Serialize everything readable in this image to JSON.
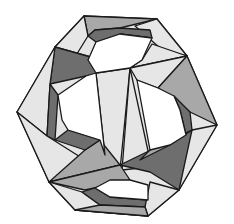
{
  "figure": {
    "title": "Woven polyhedron (triangular strip construction)",
    "colors": {
      "background": "#ffffff",
      "stroke": "#1a1a1a",
      "light": "#e6e6e6",
      "mid": "#a8a8a8",
      "dark": "#6e6e6e",
      "white_hole": "#ffffff"
    },
    "faces": [
      {
        "name": "top-strip",
        "shade": "mid",
        "points": "84,16 157,19 120,28 95,30 88,36"
      },
      {
        "name": "top-left-light",
        "shade": "light",
        "points": "84,16 55,47 75,57 88,36"
      },
      {
        "name": "top-right-light",
        "shade": "light",
        "points": "157,19 187,56 160,48 135,26"
      },
      {
        "name": "top-inner-band",
        "shade": "dark",
        "points": "88,36 95,30 120,28 150,30 152,38 120,34 96,42"
      },
      {
        "name": "upper-left-dark-big",
        "shade": "dark",
        "points": "55,47 130,68 142,60 75,57"
      },
      {
        "name": "upper-left-dark-lower",
        "shade": "dark",
        "points": "55,47 50,84 86,76 130,68"
      },
      {
        "name": "upper-right-light-a",
        "shade": "light",
        "points": "130,68 187,56 152,44 142,60"
      },
      {
        "name": "upper-right-light-b",
        "shade": "light",
        "points": "130,68 187,56 158,88 137,80"
      },
      {
        "name": "right-mid-gray",
        "shade": "mid",
        "points": "187,56 217,125 190,112 158,88"
      },
      {
        "name": "right-inner-dark",
        "shade": "dark",
        "points": "174,96 190,112 192,130 186,135 180,110"
      },
      {
        "name": "left-outer-light",
        "shade": "light",
        "points": "55,47 17,112 47,136 50,84"
      },
      {
        "name": "left-inner-dark",
        "shade": "dark",
        "points": "50,84 47,136 55,140 58,95"
      },
      {
        "name": "center-light-left",
        "shade": "light",
        "points": "96,73 130,68 120,170 105,155"
      },
      {
        "name": "center-light-right",
        "shade": "light",
        "points": "130,68 150,160 140,168 122,170"
      },
      {
        "name": "right-light-lower",
        "shade": "light",
        "points": "217,125 179,190 170,178 192,130"
      },
      {
        "name": "lower-right-dark",
        "shade": "dark",
        "points": "120,165 192,130 179,190 150,172"
      },
      {
        "name": "lower-right-mid",
        "shade": "mid",
        "points": "150,150 192,130 170,145 140,160"
      },
      {
        "name": "left-lower-light",
        "shade": "light",
        "points": "17,112 49,182 85,160 47,136"
      },
      {
        "name": "lower-left-mid",
        "shade": "mid",
        "points": "49,182 120,165 100,140 85,150"
      },
      {
        "name": "lower-left-dark",
        "shade": "dark",
        "points": "55,140 85,150 100,140 68,130"
      },
      {
        "name": "bottom-band-mid",
        "shade": "mid",
        "points": "49,182 120,165 130,180 85,190"
      },
      {
        "name": "bottom-left-light",
        "shade": "light",
        "points": "49,182 75,210 148,216 100,205 82,192"
      },
      {
        "name": "bottom-inner-dark",
        "shade": "dark",
        "points": "82,192 100,205 145,207 148,200 110,197 95,188"
      },
      {
        "name": "bottom-right-light",
        "shade": "light",
        "points": "148,216 179,190 150,182 145,207"
      },
      {
        "name": "bottom-strip",
        "shade": "mid",
        "points": "75,210 148,216 145,207 100,205"
      }
    ],
    "holes": [
      {
        "name": "top-hole",
        "points": "96,42 120,34 152,38 142,60 130,68 96,73 88,60"
      },
      {
        "name": "left-hole",
        "points": "58,95 86,76 96,73 105,155 100,140 68,130 62,120"
      },
      {
        "name": "right-hole",
        "points": "137,80 158,88 174,96 180,110 186,135 170,145 150,150"
      },
      {
        "name": "bottom-hole",
        "points": "95,188 110,180 130,180 148,185 148,200 110,197"
      }
    ]
  }
}
